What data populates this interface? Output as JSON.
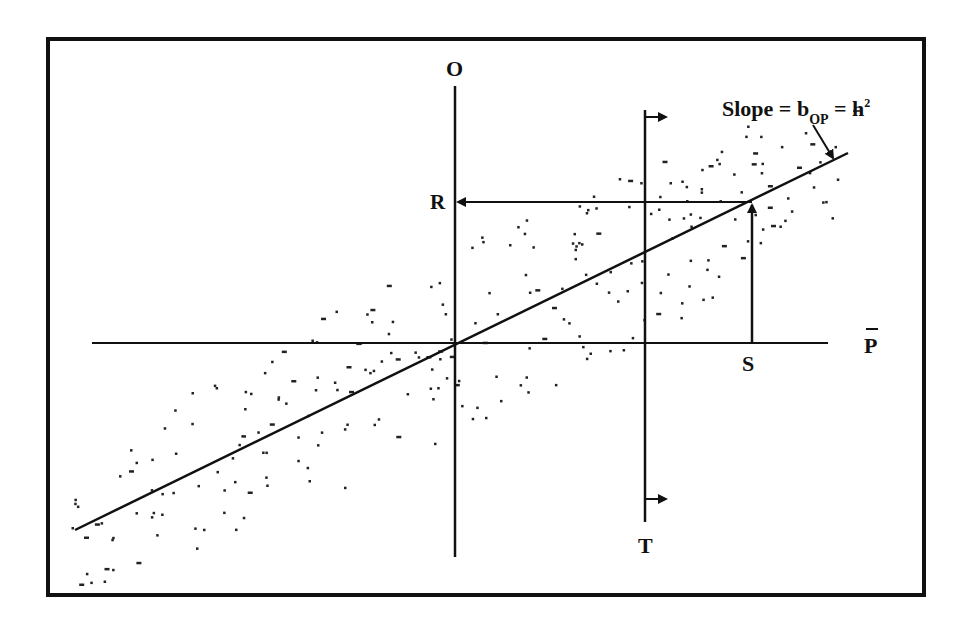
{
  "diagram": {
    "colors": {
      "ink": "#111111",
      "background": "#ffffff"
    },
    "labels": {
      "offspring_axis": "O",
      "midparent_axis": "P",
      "midparent_axis_bar": "‾",
      "response": "R",
      "selection_differential": "S",
      "truncation_point": "T",
      "slope_prefix": "Slope = b",
      "slope_subscript": "OP",
      "slope_mid": " = h",
      "slope_superscript": "2"
    },
    "elements": [
      {
        "id": "frame",
        "description": "thick rectangular border"
      },
      {
        "id": "offspring-axis",
        "description": "vertical axis labeled O"
      },
      {
        "id": "midparent-axis",
        "description": "horizontal axis labeled P-bar"
      },
      {
        "id": "regression-line",
        "description": "line through origin with slope h^2"
      },
      {
        "id": "truncation-line",
        "description": "vertical line T with right-pointing arrows indicating selected parents"
      },
      {
        "id": "selection-differential",
        "description": "vertical segment from S up to regression line"
      },
      {
        "id": "response-arrow",
        "description": "horizontal arrow from regression line to O axis at R"
      },
      {
        "id": "scatter-points",
        "description": "elliptical cloud of data points around regression line"
      }
    ]
  }
}
